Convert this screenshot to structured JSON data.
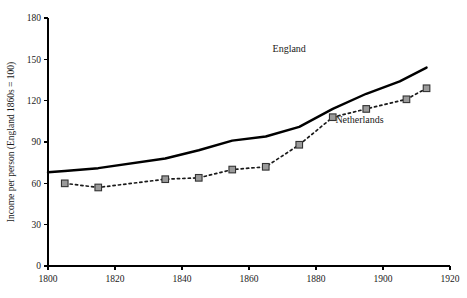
{
  "chart_data": {
    "type": "line",
    "title": "",
    "subtitle": "",
    "xlabel": "",
    "ylabel": "Income per person (England 1860s = 100)",
    "xlim": [
      1800,
      1920
    ],
    "ylim": [
      0,
      180
    ],
    "xticks": [
      1800,
      1820,
      1840,
      1860,
      1880,
      1900,
      1920
    ],
    "yticks": [
      0,
      30,
      60,
      90,
      120,
      150,
      180
    ],
    "grid": false,
    "legend_position": "inline-annotation",
    "series": [
      {
        "name": "England",
        "style": "solid-line",
        "color": "#000000",
        "marker": "none",
        "x": [
          1800,
          1805,
          1815,
          1835,
          1845,
          1855,
          1865,
          1875,
          1885,
          1895,
          1905,
          1913
        ],
        "values": [
          68,
          69,
          71,
          78,
          84,
          91,
          94,
          101,
          114,
          125,
          134,
          144
        ]
      },
      {
        "name": "Netherlands",
        "style": "dotted-line",
        "color": "#1a1a1a",
        "marker": "square",
        "marker_fill": "#9a9a9a",
        "marker_stroke": "#333333",
        "x": [
          1805,
          1815,
          1835,
          1845,
          1855,
          1865,
          1875,
          1885,
          1895,
          1907,
          1913
        ],
        "values": [
          60,
          57,
          63,
          64,
          70,
          72,
          88,
          108,
          114,
          121,
          129
        ]
      }
    ],
    "annotations": [
      {
        "text": "England",
        "x": 1872,
        "y": 155
      },
      {
        "text": "Netherlands",
        "x": 1893,
        "y": 104
      }
    ]
  },
  "axis": {
    "y_title": "Income per person (England 1860s = 100)",
    "y_tick_labels": [
      "0",
      "30",
      "60",
      "90",
      "120",
      "150",
      "180"
    ],
    "x_tick_labels": [
      "1800",
      "1820",
      "1840",
      "1860",
      "1880",
      "1900",
      "1920"
    ]
  },
  "labels": {
    "england": "England",
    "netherlands": "Netherlands"
  }
}
